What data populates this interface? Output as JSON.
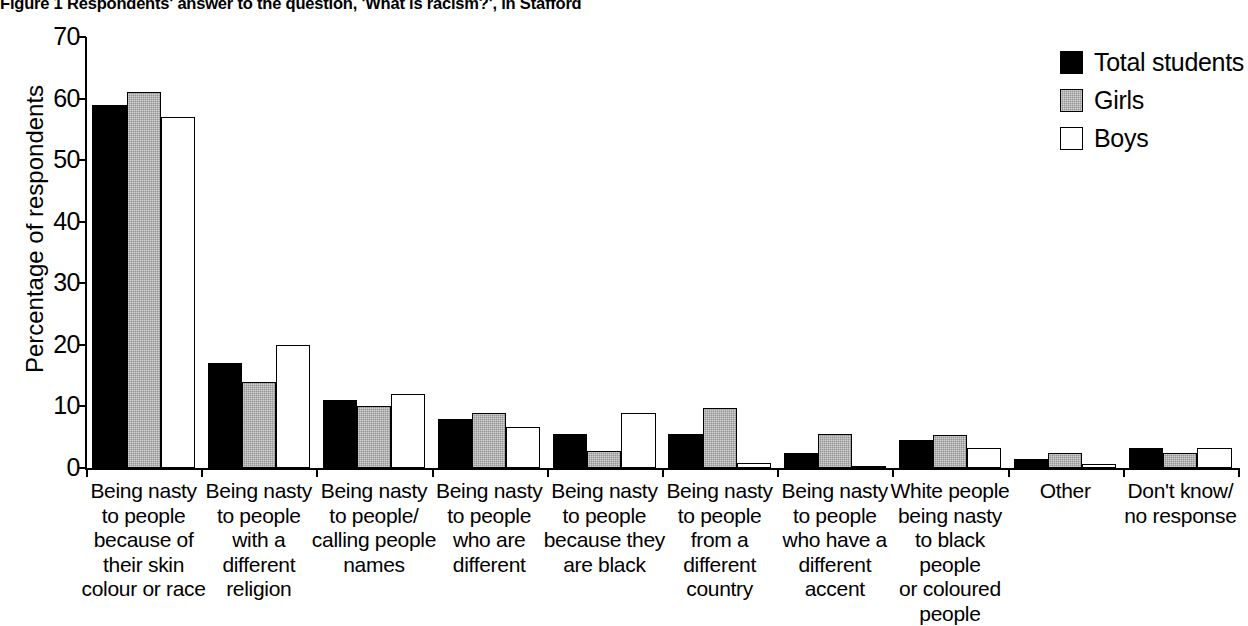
{
  "figure": {
    "title": "Figure 1 Respondents' answer to the question, 'What is racism?', in Stafford"
  },
  "chart_data": {
    "type": "bar",
    "title": "Figure 1 Respondents' answer to the question, 'What is racism?', in Stafford",
    "xlabel": "",
    "ylabel": "Percentage of respondents",
    "ylim": [
      0,
      70
    ],
    "yticks": [
      0,
      10,
      20,
      30,
      40,
      50,
      60,
      70
    ],
    "grid": false,
    "legend_position": "top-right",
    "categories": [
      "Being nasty to people because of their skin colour or race",
      "Being nasty to people with a different religion",
      "Being nasty to people/ calling people names",
      "Being nasty to people who are different",
      "Being nasty to people because they are black",
      "Being nasty to people from a different country",
      "Being nasty to people who have a different accent",
      "White people being nasty to black people or coloured people",
      "Other",
      "Don't know/ no response"
    ],
    "category_lines": [
      [
        "Being nasty",
        "to people",
        "because of",
        "their skin",
        "colour or race"
      ],
      [
        "Being nasty",
        "to people",
        "with a",
        "different",
        "religion"
      ],
      [
        "Being nasty",
        "to people/",
        "calling people",
        "names"
      ],
      [
        "Being nasty",
        "to people",
        "who are",
        "different"
      ],
      [
        "Being nasty",
        "to people",
        "because they",
        "are black"
      ],
      [
        "Being nasty",
        "to people",
        "from a",
        "different",
        "country"
      ],
      [
        "Being nasty",
        "to people",
        "who have a",
        "different",
        "accent"
      ],
      [
        "White people",
        "being nasty",
        "to black people",
        "or coloured",
        "people"
      ],
      [
        "Other"
      ],
      [
        "Don't know/",
        "no response"
      ]
    ],
    "series": [
      {
        "name": "Total students",
        "color": "#000000",
        "style": "solid-black",
        "values": [
          59,
          17,
          11,
          8,
          5.5,
          5.5,
          2.5,
          4.5,
          1.4,
          3.3
        ]
      },
      {
        "name": "Girls",
        "color": "#959595",
        "style": "hatched-grey",
        "values": [
          61,
          14,
          10,
          9,
          2.8,
          9.8,
          5.5,
          5.4,
          2.4,
          2.4
        ]
      },
      {
        "name": "Boys",
        "color": "#ffffff",
        "style": "outline-white",
        "values": [
          57,
          20,
          12,
          6.6,
          9,
          0.8,
          0.4,
          3.3,
          0.6,
          3.3
        ]
      }
    ]
  },
  "legend": {
    "items": [
      {
        "label": "Total students",
        "swatch": "total"
      },
      {
        "label": "Girls",
        "swatch": "girls"
      },
      {
        "label": "Boys",
        "swatch": "boys"
      }
    ]
  }
}
